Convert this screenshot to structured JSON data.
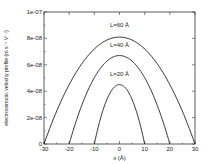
{
  "chart_data": {
    "type": "line",
    "title": "",
    "xlabel": "x (Å)",
    "ylabel": "electroosmotic velocity profile (m s⁻¹ V⁻¹)",
    "xlim": [
      -30,
      30
    ],
    "ylim": [
      0,
      1e-07
    ],
    "x_ticks": [
      -30,
      -20,
      -10,
      0,
      10,
      20,
      30
    ],
    "x_tick_labels": [
      "-30",
      "-20",
      "-10",
      "0",
      "10",
      "20",
      "30"
    ],
    "y_ticks": [
      0,
      2e-08,
      4e-08,
      6e-08,
      8e-08,
      1e-07
    ],
    "y_tick_labels": [
      "0",
      "2e-08",
      "4e-08",
      "6e-08",
      "8e-08",
      "1e-07"
    ],
    "grid": false,
    "legend": "none (inline curve labels)",
    "series": [
      {
        "name": "L=60 Å",
        "label": "L=60 Å",
        "half_width": 30,
        "peak_x": 0,
        "peak_y": 8.1e-08,
        "x": [
          -30,
          -20,
          -10,
          0,
          10,
          20,
          30
        ],
        "y": [
          0,
          4.5e-08,
          7.2e-08,
          8.1e-08,
          7.2e-08,
          4.5e-08,
          0
        ],
        "label_pos": [
          0,
          8.9e-08
        ]
      },
      {
        "name": "L=40 Å",
        "label": "L=40 Å",
        "half_width": 20,
        "peak_x": 0,
        "peak_y": 6.7e-08,
        "x": [
          -20,
          -10,
          0,
          10,
          20
        ],
        "y": [
          0,
          5e-08,
          6.7e-08,
          5e-08,
          0
        ],
        "label_pos": [
          0,
          7.35e-08
        ]
      },
      {
        "name": "L=20 Å",
        "label": "L=20 Å",
        "half_width": 10,
        "peak_x": 0,
        "peak_y": 4.5e-08,
        "x": [
          -10,
          -5,
          0,
          5,
          10
        ],
        "y": [
          0,
          3.4e-08,
          4.5e-08,
          3.4e-08,
          0
        ],
        "label_pos": [
          0,
          5.15e-08
        ]
      }
    ]
  }
}
